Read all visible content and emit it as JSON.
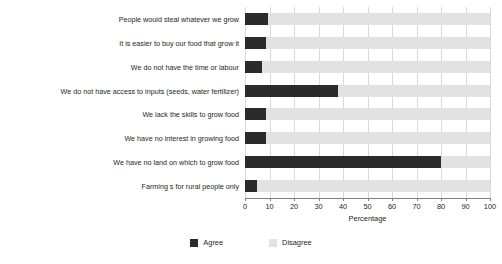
{
  "chart_data": {
    "type": "bar",
    "orientation": "horizontal",
    "stacked": true,
    "title": "",
    "xlabel": "Percentage",
    "ylabel": "",
    "xlim": [
      0,
      100
    ],
    "xticks": [
      0,
      10,
      20,
      30,
      40,
      50,
      60,
      70,
      80,
      90,
      100
    ],
    "xtick_labels": [
      "0",
      "10",
      "20",
      "30",
      "40",
      "50",
      "60",
      "70",
      "80",
      "90",
      "100"
    ],
    "grid": true,
    "grid_axis": "x",
    "legend_position": "bottom-center",
    "categories": [
      "People would steal whatever we grow",
      "It is easier to buy our food that grow it",
      "We do not have the time or labour",
      "We do not have access to inputs (seeds, water fertilizer)",
      "We lack the skills to grow food",
      "We have no interest in growing food",
      "We have no land on which to grow food",
      "Farming s for rural people only"
    ],
    "series": [
      {
        "name": "Agree",
        "color": "#2b2b2b",
        "values": [
          9.5,
          8.5,
          7,
          38,
          8.5,
          8.5,
          80,
          5
        ]
      },
      {
        "name": "Disagree",
        "color": "#e2e2e2",
        "values": [
          90.5,
          91.5,
          93,
          62,
          91.5,
          91.5,
          20,
          95
        ]
      }
    ]
  },
  "legend": {
    "items": [
      {
        "label": "Agree",
        "swatch": "agree"
      },
      {
        "label": "Disagree",
        "swatch": "disagree"
      }
    ]
  },
  "axis": {
    "x_title": "Percentage"
  },
  "colors": {
    "agree": "#2b2b2b",
    "disagree": "#e2e2e2",
    "gridline": "#d9d9d9",
    "axis": "#808080",
    "text": "#231f20",
    "background": "#ffffff"
  }
}
